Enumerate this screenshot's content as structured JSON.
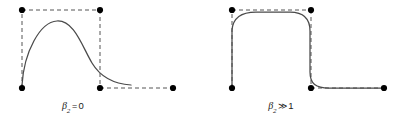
{
  "figure": {
    "background_color": "#ffffff",
    "curve_color": "#4a4a4a",
    "control_polygon_color": "#555555",
    "control_point_color": "#000000",
    "panels": [
      {
        "id": "panel-left",
        "caption": {
          "variable": "β",
          "subscript": "2",
          "operator": "=",
          "value": "0",
          "full_text": "β2 = 0"
        },
        "caption_center_x": 73,
        "control_points": [
          {
            "label": "P0",
            "x": 22,
            "y": 88
          },
          {
            "label": "P1",
            "x": 22,
            "y": 10
          },
          {
            "label": "P2",
            "x": 100,
            "y": 10
          },
          {
            "label": "P3",
            "x": 100,
            "y": 88
          },
          {
            "label": "P4",
            "x": 173,
            "y": 88
          }
        ],
        "curve_path": "M 22,85 C 24,52 40,22 57,21 C 74,20 82,46 92,63 C 101,78 116,84 131,85",
        "polygon_segments": [
          {
            "from": [
              22,
              88
            ],
            "to": [
              22,
              10
            ]
          },
          {
            "from": [
              22,
              10
            ],
            "to": [
              100,
              10
            ]
          },
          {
            "from": [
              100,
              10
            ],
            "to": [
              100,
              88
            ]
          },
          {
            "from": [
              100,
              88
            ],
            "to": [
              173,
              88
            ]
          }
        ]
      },
      {
        "id": "panel-right",
        "caption": {
          "variable": "β",
          "subscript": "2",
          "operator": "≫",
          "value": "1",
          "full_text": "β2 ≫ 1"
        },
        "caption_center_x": 281,
        "control_points": [
          {
            "label": "P0",
            "x": 232,
            "y": 88
          },
          {
            "label": "P1",
            "x": 232,
            "y": 10
          },
          {
            "label": "P2",
            "x": 311,
            "y": 10
          },
          {
            "label": "P3",
            "x": 311,
            "y": 88
          },
          {
            "label": "P4",
            "x": 384,
            "y": 88
          }
        ],
        "curve_path": "M 232,86 L 232,30 C 233,17 242,12 256,12 L 290,12 C 303,12 310,18 310,31 L 310,72 C 310,84 316,88 329,88 L 381,88",
        "polygon_segments": [
          {
            "from": [
              232,
              88
            ],
            "to": [
              232,
              10
            ]
          },
          {
            "from": [
              232,
              10
            ],
            "to": [
              311,
              10
            ]
          },
          {
            "from": [
              311,
              10
            ],
            "to": [
              311,
              88
            ]
          },
          {
            "from": [
              311,
              88
            ],
            "to": [
              384,
              88
            ]
          }
        ]
      }
    ],
    "style": {
      "dash_pattern": "4,3",
      "control_point_radius": 3.1,
      "curve_stroke_width": 1.25,
      "polygon_stroke_width": 1
    }
  }
}
